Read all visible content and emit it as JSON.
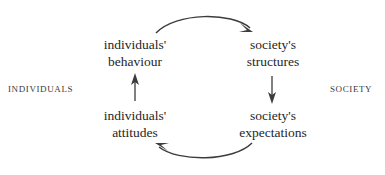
{
  "diagram": {
    "stroke_color": "#3c3c3c",
    "text_color": "#262626",
    "background_color": "#ffffff",
    "nodes": [
      {
        "id": "individuals-behaviour",
        "line1": "individuals'",
        "line2": "behaviour",
        "position": "top-left"
      },
      {
        "id": "society-structures",
        "line1": "society's",
        "line2": "structures",
        "position": "top-right"
      },
      {
        "id": "individuals-attitudes",
        "line1": "individuals'",
        "line2": "attitudes",
        "position": "bottom-left"
      },
      {
        "id": "society-expectations",
        "line1": "society's",
        "line2": "expectations",
        "position": "bottom-right"
      }
    ],
    "side_labels": {
      "left": "INDIVIDUALS",
      "right": "SOCIETY"
    },
    "arrows": [
      {
        "id": "arc-top",
        "from": "individuals-behaviour",
        "to": "society-structures",
        "shape": "curved-arc",
        "direction": "right"
      },
      {
        "id": "arrow-right",
        "from": "society-structures",
        "to": "society-expectations",
        "shape": "straight",
        "direction": "down"
      },
      {
        "id": "arc-bottom",
        "from": "society-expectations",
        "to": "individuals-attitudes",
        "shape": "curved-arc",
        "direction": "left"
      },
      {
        "id": "arrow-left",
        "from": "individuals-attitudes",
        "to": "individuals-behaviour",
        "shape": "straight",
        "direction": "up"
      }
    ]
  }
}
